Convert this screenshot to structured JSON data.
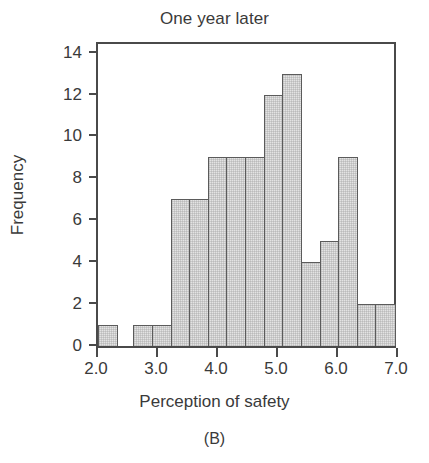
{
  "figure": {
    "panel_caption": "(B)"
  },
  "chart_data": {
    "type": "bar",
    "title": "One year later",
    "xlabel": "Perception of safety",
    "ylabel": "Frequency",
    "grid": false,
    "legend": null,
    "xlim": [
      2.0,
      7.0
    ],
    "ylim": [
      0,
      14.6
    ],
    "xtick_labels": [
      "2.0",
      "3.0",
      "4.0",
      "5.0",
      "6.0",
      "7.0"
    ],
    "xtick_values": [
      2.0,
      3.0,
      4.0,
      5.0,
      6.0,
      7.0
    ],
    "ytick_labels": [
      "0",
      "2",
      "4",
      "6",
      "8",
      "10",
      "12",
      "14"
    ],
    "ytick_values": [
      0,
      2,
      4,
      6,
      8,
      10,
      12,
      14
    ],
    "bin_width": 0.3125,
    "bin_edges": [
      2.0,
      2.3125,
      2.625,
      2.9375,
      3.25,
      3.5625,
      3.875,
      4.1875,
      4.5,
      4.8125,
      5.125,
      5.4375,
      5.75,
      6.0625,
      6.375,
      6.6875,
      7.0
    ],
    "categories": [
      "2.00-2.31",
      "2.31-2.63",
      "2.63-2.94",
      "2.94-3.25",
      "3.25-3.56",
      "3.56-3.88",
      "3.88-4.19",
      "4.19-4.50",
      "4.50-4.81",
      "4.81-5.13",
      "5.13-5.44",
      "5.44-5.75",
      "5.75-6.06",
      "6.06-6.38",
      "6.38-6.69",
      "6.69-7.00"
    ],
    "values": [
      1,
      0,
      1,
      1,
      7,
      7,
      9,
      9,
      9,
      12,
      13,
      4,
      5,
      9,
      2,
      2
    ],
    "total_count": 92,
    "bar_fill_color": "#e3e3e3",
    "bar_edge_color": "#5b5b5b",
    "axis_color": "#4a4a4a",
    "text_color": "#3a3a3a",
    "background_color": "#ffffff"
  }
}
